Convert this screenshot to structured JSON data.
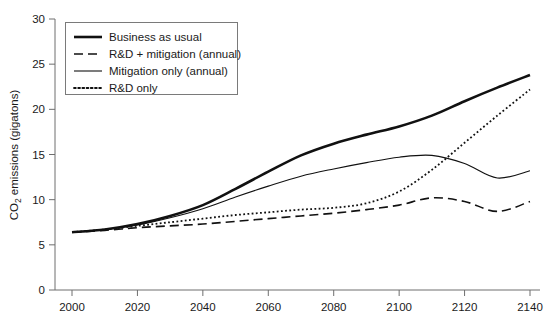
{
  "chart_data": {
    "type": "line",
    "title": "",
    "xlabel": "",
    "ylabel": "CO2 emissions (gigatons)",
    "ylabel_parts": {
      "pre": "CO",
      "sub": "2",
      "post": " emissions (gigatons)"
    },
    "xlim": [
      2000,
      2140
    ],
    "ylim": [
      0,
      30
    ],
    "xticks": [
      2000,
      2020,
      2040,
      2060,
      2080,
      2100,
      2120,
      2140
    ],
    "yticks": [
      0,
      5,
      10,
      15,
      20,
      25,
      30
    ],
    "grid": false,
    "legend_position": "top-left",
    "x": [
      2000,
      2010,
      2020,
      2030,
      2040,
      2050,
      2060,
      2070,
      2080,
      2090,
      2100,
      2110,
      2120,
      2130,
      2140
    ],
    "series": [
      {
        "name": "Business as usual",
        "style": "solid-thick",
        "color": "#111111",
        "width": 2.6,
        "values": [
          6.4,
          6.7,
          7.3,
          8.2,
          9.4,
          11.2,
          13.1,
          14.9,
          16.2,
          17.2,
          18.1,
          19.3,
          20.9,
          22.4,
          23.8
        ]
      },
      {
        "name": "R&D + mitigation (annual)",
        "style": "dashed",
        "color": "#111111",
        "width": 1.6,
        "values": [
          6.4,
          6.6,
          6.9,
          7.1,
          7.3,
          7.6,
          7.9,
          8.2,
          8.5,
          8.9,
          9.4,
          10.2,
          9.8,
          8.7,
          9.8
        ]
      },
      {
        "name": "Mitigation only (annual)",
        "style": "solid-thin",
        "color": "#111111",
        "width": 1.1,
        "values": [
          6.4,
          6.7,
          7.2,
          8.0,
          9.0,
          10.3,
          11.5,
          12.6,
          13.4,
          14.1,
          14.7,
          14.9,
          14.0,
          12.4,
          13.2
        ]
      },
      {
        "name": "R&D only",
        "style": "dotted",
        "color": "#111111",
        "width": 1.8,
        "values": [
          6.4,
          6.7,
          7.1,
          7.5,
          7.9,
          8.3,
          8.6,
          8.9,
          9.1,
          9.6,
          10.9,
          13.3,
          16.3,
          19.3,
          22.2
        ]
      }
    ]
  },
  "legend": {
    "entries": [
      {
        "label": "Business as usual"
      },
      {
        "label": "R&D + mitigation (annual)"
      },
      {
        "label": "Mitigation only (annual)"
      },
      {
        "label": "R&D only"
      }
    ]
  }
}
